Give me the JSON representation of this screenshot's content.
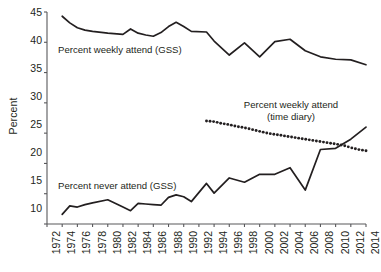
{
  "axes": {
    "ylabel": "Percent",
    "yticks": [
      "45",
      "40",
      "35",
      "30",
      "25",
      "20",
      "15",
      "10"
    ],
    "xticks": [
      "1972",
      "1974",
      "1976",
      "1978",
      "1980",
      "1982",
      "1984",
      "1986",
      "1988",
      "1990",
      "1992",
      "1994",
      "1996",
      "1998",
      "2000",
      "2002",
      "2004",
      "2006",
      "2008",
      "2010",
      "2012",
      "2014"
    ]
  },
  "annotations": {
    "weekly_gss": "Percent weekly attend (GSS)",
    "never_gss": "Percent never attend (GSS)",
    "time_diary_line1": "Percent weekly attend",
    "time_diary_line2": "(time diary)"
  },
  "colors": {
    "line": "#231f20",
    "axis": "#58585b",
    "background": "#ffffff"
  },
  "chart_data": {
    "type": "line",
    "title": "",
    "xlabel": "",
    "ylabel": "Percent",
    "xlim": [
      1972,
      2014
    ],
    "ylim": [
      10,
      45
    ],
    "ytick_step": 5,
    "xtick_step": 2,
    "grid": false,
    "legend": "inline-annotations",
    "series": [
      {
        "name": "Percent weekly attend (GSS)",
        "style": "solid",
        "x": [
          1974,
          1975,
          1976,
          1977,
          1978,
          1980,
          1982,
          1983,
          1984,
          1985,
          1986,
          1987,
          1988,
          1989,
          1990,
          1991,
          1993,
          1994,
          1996,
          1998,
          2000,
          2002,
          2004,
          2006,
          2008,
          2010,
          2012,
          2014
        ],
        "values": [
          44.3,
          43.2,
          42.4,
          42.0,
          41.8,
          41.5,
          41.3,
          42.2,
          41.5,
          41.2,
          41.0,
          41.6,
          42.6,
          43.3,
          42.6,
          41.8,
          41.7,
          40.2,
          37.9,
          39.9,
          37.6,
          40.1,
          40.5,
          38.6,
          37.6,
          37.2,
          37.1,
          36.3
        ]
      },
      {
        "name": "Percent weekly attend (time diary)",
        "style": "dotted",
        "x": [
          1993,
          1994,
          1995,
          1996,
          1997,
          1998,
          1999,
          2000,
          2001,
          2002,
          2003,
          2004,
          2005,
          2006,
          2007,
          2008,
          2009,
          2010,
          2011,
          2012,
          2013,
          2014
        ],
        "values": [
          27.0,
          26.9,
          26.6,
          26.4,
          26.1,
          25.9,
          25.6,
          25.3,
          25.0,
          24.8,
          24.6,
          24.4,
          24.2,
          24.0,
          23.8,
          23.6,
          23.4,
          23.2,
          23.0,
          22.6,
          22.3,
          22.1
        ]
      },
      {
        "name": "Percent never attend (GSS)",
        "style": "solid",
        "x": [
          1974,
          1975,
          1976,
          1977,
          1978,
          1980,
          1982,
          1983,
          1984,
          1985,
          1986,
          1987,
          1988,
          1989,
          1990,
          1991,
          1993,
          1994,
          1996,
          1998,
          2000,
          2002,
          2004,
          2006,
          2008,
          2010,
          2012,
          2014
        ],
        "values": [
          11.6,
          13.0,
          12.8,
          13.2,
          13.5,
          14.0,
          12.8,
          12.2,
          13.4,
          13.3,
          13.2,
          13.1,
          14.4,
          14.8,
          14.5,
          13.7,
          16.7,
          15.1,
          17.6,
          16.9,
          18.2,
          18.2,
          19.3,
          15.6,
          22.3,
          22.5,
          24.0,
          26.0
        ]
      }
    ]
  }
}
